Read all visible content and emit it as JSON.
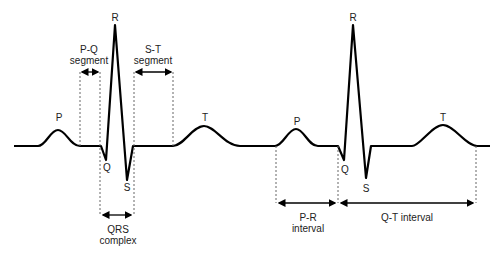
{
  "waves": {
    "p1": "P",
    "q1": "Q",
    "r1": "R",
    "s1": "S",
    "t1": "T",
    "p2": "P",
    "q2": "Q",
    "r2": "R",
    "s2": "S",
    "t2": "T"
  },
  "segments": {
    "pq_line1": "P-Q",
    "pq_line2": "segment",
    "st_line1": "S-T",
    "st_line2": "segment",
    "qrs_line1": "QRS",
    "qrs_line2": "complex",
    "pr_line1": "P-R",
    "pr_line2": "interval",
    "qt": "Q-T interval"
  },
  "colors": {
    "trace": "#000000",
    "guide": "#555555",
    "text": "#222222"
  }
}
